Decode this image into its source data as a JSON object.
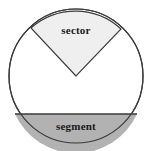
{
  "diagram": {
    "background_color": "#ffffff",
    "stroke_color": "#3a3a3a",
    "labels": {
      "sector": "sector",
      "segment": "segment"
    },
    "label_color": "#1a1a1a",
    "circle": {
      "center_x": 76,
      "center_y": 76,
      "radius": 67,
      "fill_color": "#ffffff",
      "stroke_width": 1.2
    },
    "sector": {
      "name": "sector",
      "fill_color": "#efefef",
      "apex_x": 76,
      "apex_y": 76,
      "start_point_x": 31,
      "start_point_y": 28,
      "end_point_x": 121,
      "end_point_y": 29,
      "sweep_description": "wedge from center up to the top arc"
    },
    "segment": {
      "name": "segment",
      "fill_color": "#b2b2b2",
      "chord_y": 114,
      "chord_left_x": 15,
      "chord_right_x": 137,
      "chord_stroke_color": "#3a3a3a",
      "region_description": "area between the horizontal chord and the lower arc"
    }
  }
}
